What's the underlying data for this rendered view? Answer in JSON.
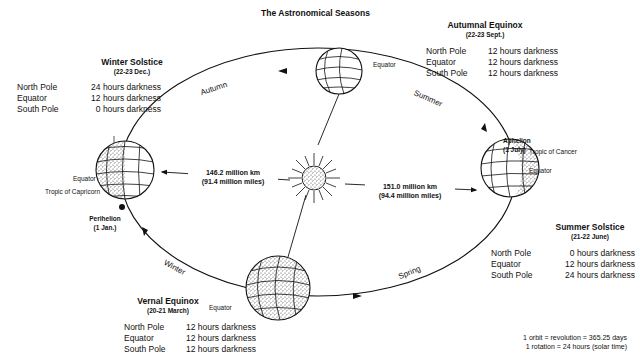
{
  "title": "The Astronomical Seasons",
  "positions": {
    "winter_solstice": {
      "name": "Winter Solstice",
      "date": "(22-23 Dec.)",
      "rows": [
        {
          "place": "North Pole",
          "darkness": "24 hours darkness"
        },
        {
          "place": "Equator",
          "darkness": "12 hours darkness"
        },
        {
          "place": "South Pole",
          "darkness": "0 hours darkness"
        }
      ]
    },
    "autumnal_equinox": {
      "name": "Autumnal Equinox",
      "date": "(22-23 Sept.)",
      "rows": [
        {
          "place": "North Pole",
          "darkness": "12 hours darkness"
        },
        {
          "place": "Equator",
          "darkness": "12 hours darkness"
        },
        {
          "place": "South Pole",
          "darkness": "12 hours darkness"
        }
      ]
    },
    "summer_solstice": {
      "name": "Summer Solstice",
      "date": "(21-22 June)",
      "rows": [
        {
          "place": "North Pole",
          "darkness": "0 hours darkness"
        },
        {
          "place": "Equator",
          "darkness": "12 hours darkness"
        },
        {
          "place": "South Pole",
          "darkness": "24 hours darkness"
        }
      ]
    },
    "vernal_equinox": {
      "name": "Vernal Equinox",
      "date": "(20-21 March)",
      "rows": [
        {
          "place": "North Pole",
          "darkness": "12 hours darkness"
        },
        {
          "place": "Equator",
          "darkness": "12 hours darkness"
        },
        {
          "place": "South Pole",
          "darkness": "12 hours darkness"
        }
      ]
    }
  },
  "seasons": {
    "autumn": "Autumn",
    "summer": "Summer",
    "winter": "Winter",
    "spring": "Spring"
  },
  "orbit_points": {
    "perihelion": {
      "name": "Perihelion",
      "date": "(1 Jan.)"
    },
    "aphelion": {
      "name": "Aphelion",
      "date": "(1 July)"
    }
  },
  "globe_labels": {
    "equator": "Equator",
    "tropic_of_capricorn": "Tropic of Capricorn",
    "tropic_of_cancer": "Tropic of Cancer"
  },
  "distances": {
    "perihelion": {
      "km": "146.2 million km",
      "miles": "(91.4 million miles)"
    },
    "aphelion": {
      "km": "151.0 million km",
      "miles": "(94.4 million miles)"
    }
  },
  "facts": {
    "orbit": "1 orbit = revolution = 365.25 days",
    "rotation": "1 rotation = 24 hours (solar time)"
  },
  "colors": {
    "ink": "#111111",
    "background": "#ffffff",
    "stipple": "#555555"
  }
}
